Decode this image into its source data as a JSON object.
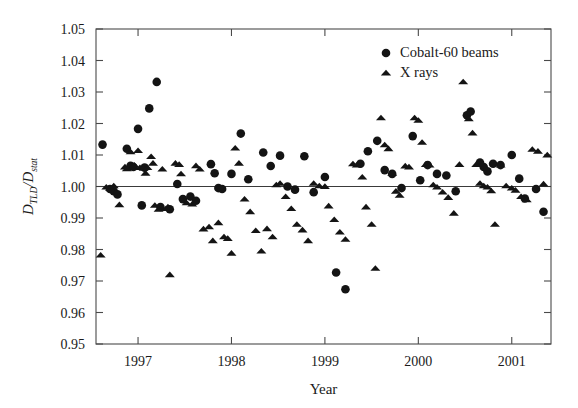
{
  "chart_data": {
    "type": "scatter",
    "title": "",
    "xlabel": "Year",
    "ylabel": "D_TLD / D_stat",
    "ylabel_parts": {
      "main1": "D",
      "sub1": "TLD",
      "slash": "/",
      "main2": "D",
      "sub2": "stat"
    },
    "xlim": [
      1996.55,
      2001.42
    ],
    "ylim": [
      0.95,
      1.05
    ],
    "xticks": [
      1997,
      1998,
      1999,
      2000,
      2001
    ],
    "xticklabels": [
      "1997",
      "1998",
      "1999",
      "2000",
      "2001"
    ],
    "yticks": [
      0.95,
      0.96,
      0.97,
      0.98,
      0.99,
      1.0,
      1.01,
      1.02,
      1.03,
      1.04,
      1.05
    ],
    "yticklabels": [
      "0.95",
      "0.96",
      "0.97",
      "0.98",
      "0.99",
      "1.00",
      "1.01",
      "1.02",
      "1.03",
      "1.04",
      "1.05"
    ],
    "grid": false,
    "reference_line": {
      "y": 1.0,
      "color": "#3a3a3a"
    },
    "legend": {
      "position": "top-right",
      "entries": [
        {
          "label": "Cobalt-60 beams",
          "marker": "circle",
          "color": "#141414"
        },
        {
          "label": "X rays",
          "marker": "triangle",
          "color": "#141414"
        }
      ]
    },
    "series": [
      {
        "name": "Cobalt-60 beams",
        "marker": "circle",
        "color": "#141414",
        "points": [
          [
            1996.62,
            1.0133
          ],
          [
            1996.7,
            0.9992
          ],
          [
            1996.74,
            0.9985
          ],
          [
            1996.78,
            0.9975
          ],
          [
            1996.88,
            1.012
          ],
          [
            1996.92,
            1.0066
          ],
          [
            1996.95,
            1.0062
          ],
          [
            1997.0,
            1.0183
          ],
          [
            1997.04,
            0.994
          ],
          [
            1997.07,
            1.006
          ],
          [
            1997.12,
            1.0248
          ],
          [
            1997.2,
            1.0332
          ],
          [
            1997.24,
            0.9935
          ],
          [
            1997.34,
            0.9928
          ],
          [
            1997.42,
            1.0008
          ],
          [
            1997.48,
            0.996
          ],
          [
            1997.56,
            0.9968
          ],
          [
            1997.62,
            0.9955
          ],
          [
            1997.78,
            1.0071
          ],
          [
            1997.82,
            1.0042
          ],
          [
            1997.86,
            0.9995
          ],
          [
            1997.9,
            0.9992
          ],
          [
            1998.0,
            1.004
          ],
          [
            1998.1,
            1.0168
          ],
          [
            1998.18,
            1.0023
          ],
          [
            1998.34,
            1.0108
          ],
          [
            1998.42,
            1.0065
          ],
          [
            1998.52,
            1.0098
          ],
          [
            1998.6,
            1.0
          ],
          [
            1998.68,
            0.999
          ],
          [
            1998.78,
            1.0096
          ],
          [
            1998.88,
            0.9982
          ],
          [
            1999.0,
            1.003
          ],
          [
            1999.12,
            0.9727
          ],
          [
            1999.22,
            0.9674
          ],
          [
            1999.38,
            1.0072
          ],
          [
            1999.46,
            1.0112
          ],
          [
            1999.56,
            1.0145
          ],
          [
            1999.64,
            1.0052
          ],
          [
            1999.72,
            1.004
          ],
          [
            1999.82,
            0.9995
          ],
          [
            1999.94,
            1.016
          ],
          [
            2000.02,
            1.002
          ],
          [
            2000.1,
            1.0068
          ],
          [
            2000.2,
            1.004
          ],
          [
            2000.3,
            1.0035
          ],
          [
            2000.4,
            0.9985
          ],
          [
            2000.52,
            1.0226
          ],
          [
            2000.56,
            1.0238
          ],
          [
            2000.66,
            1.0076
          ],
          [
            2000.7,
            1.0062
          ],
          [
            2000.74,
            1.0048
          ],
          [
            2000.8,
            1.0072
          ],
          [
            2000.88,
            1.0068
          ],
          [
            2001.0,
            1.01
          ],
          [
            2001.08,
            1.0025
          ],
          [
            2001.14,
            0.9962
          ],
          [
            2001.26,
            0.9992
          ],
          [
            2001.34,
            0.992
          ]
        ]
      },
      {
        "name": "X rays",
        "marker": "triangle",
        "color": "#141414",
        "points": [
          [
            1996.6,
            0.9782
          ],
          [
            1996.66,
            0.9998
          ],
          [
            1996.7,
            0.9994
          ],
          [
            1996.74,
            1.0002
          ],
          [
            1996.8,
            0.9942
          ],
          [
            1996.86,
            1.0062
          ],
          [
            1996.88,
            1.0056
          ],
          [
            1996.92,
            1.011
          ],
          [
            1996.96,
            1.0068
          ],
          [
            1997.0,
            1.0114
          ],
          [
            1997.02,
            1.006
          ],
          [
            1997.06,
            1.0058
          ],
          [
            1997.08,
            1.0042
          ],
          [
            1997.1,
            1.006
          ],
          [
            1997.14,
            1.0095
          ],
          [
            1997.16,
            1.0074
          ],
          [
            1997.18,
            0.994
          ],
          [
            1997.22,
            0.9928
          ],
          [
            1997.26,
            1.0055
          ],
          [
            1997.3,
            0.993
          ],
          [
            1997.32,
            0.9935
          ],
          [
            1997.34,
            0.972
          ],
          [
            1997.4,
            1.0074
          ],
          [
            1997.44,
            1.007
          ],
          [
            1997.46,
            1.004
          ],
          [
            1997.52,
            0.9948
          ],
          [
            1997.58,
            0.9944
          ],
          [
            1997.62,
            1.0066
          ],
          [
            1997.66,
            1.0055
          ],
          [
            1997.7,
            0.9865
          ],
          [
            1997.76,
            0.9872
          ],
          [
            1997.8,
            0.9828
          ],
          [
            1997.86,
            0.9885
          ],
          [
            1997.92,
            0.984
          ],
          [
            1997.96,
            0.9835
          ],
          [
            1998.0,
            0.9788
          ],
          [
            1998.04,
            1.0122
          ],
          [
            1998.08,
            1.0074
          ],
          [
            1998.14,
            0.996
          ],
          [
            1998.2,
            0.992
          ],
          [
            1998.26,
            0.986
          ],
          [
            1998.32,
            0.9795
          ],
          [
            1998.38,
            0.9866
          ],
          [
            1998.44,
            0.984
          ],
          [
            1998.48,
            1.0005
          ],
          [
            1998.52,
            1.001
          ],
          [
            1998.58,
            0.9968
          ],
          [
            1998.64,
            0.993
          ],
          [
            1998.7,
            0.988
          ],
          [
            1998.76,
            0.9862
          ],
          [
            1998.82,
            0.9828
          ],
          [
            1998.88,
            1.001
          ],
          [
            1998.94,
            1.0002
          ],
          [
            1999.0,
            1.0
          ],
          [
            1999.04,
            0.9938
          ],
          [
            1999.1,
            0.9895
          ],
          [
            1999.16,
            0.9855
          ],
          [
            1999.22,
            0.9832
          ],
          [
            1999.3,
            1.0072
          ],
          [
            1999.34,
            1.0068
          ],
          [
            1999.4,
            1.003
          ],
          [
            1999.44,
            0.9935
          ],
          [
            1999.5,
            0.988
          ],
          [
            1999.54,
            0.974
          ],
          [
            1999.6,
            1.0218
          ],
          [
            1999.64,
            1.0132
          ],
          [
            1999.68,
            1.012
          ],
          [
            1999.72,
            1.0042
          ],
          [
            1999.76,
            0.9985
          ],
          [
            1999.8,
            0.9972
          ],
          [
            1999.86,
            1.0065
          ],
          [
            1999.9,
            1.0062
          ],
          [
            1999.96,
            1.0218
          ],
          [
            2000.0,
            1.021
          ],
          [
            2000.04,
            1.014
          ],
          [
            2000.08,
            1.007
          ],
          [
            2000.12,
            1.0068
          ],
          [
            2000.16,
            1.0005
          ],
          [
            2000.2,
            0.9998
          ],
          [
            2000.26,
            0.9982
          ],
          [
            2000.32,
            0.9965
          ],
          [
            2000.38,
            0.9915
          ],
          [
            2000.44,
            1.007
          ],
          [
            2000.48,
            1.0332
          ],
          [
            2000.54,
            1.0215
          ],
          [
            2000.58,
            1.017
          ],
          [
            2000.62,
            1.007
          ],
          [
            2000.66,
            1.001
          ],
          [
            2000.7,
            1.0002
          ],
          [
            2000.74,
            0.9998
          ],
          [
            2000.78,
            0.9986
          ],
          [
            2000.82,
            0.988
          ],
          [
            2000.88,
            1.0068
          ],
          [
            2000.94,
            1.0002
          ],
          [
            2001.0,
            0.9995
          ],
          [
            2001.04,
            0.9988
          ],
          [
            2001.1,
            0.9968
          ],
          [
            2001.16,
            0.9958
          ],
          [
            2001.22,
            1.0118
          ],
          [
            2001.28,
            1.0112
          ],
          [
            2001.34,
            1.0008
          ],
          [
            2001.38,
            1.01
          ]
        ]
      }
    ]
  }
}
